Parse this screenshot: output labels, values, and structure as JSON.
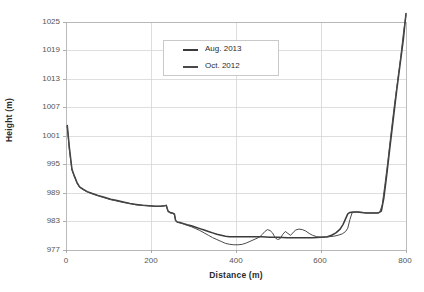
{
  "chart_data": {
    "type": "line",
    "title": "",
    "xlabel": "Distance (m)",
    "ylabel": "Height (m)",
    "xlim": [
      0,
      800
    ],
    "ylim": [
      977,
      1025
    ],
    "xticks": [
      0,
      200,
      400,
      600,
      800
    ],
    "yticks": [
      977,
      983,
      989,
      995,
      1001,
      1007,
      1013,
      1019,
      1025
    ],
    "grid": true,
    "legend_position": "top-center",
    "series": [
      {
        "name": "Aug. 2013",
        "color": "#3a3a3a",
        "points": [
          [
            3,
            1003.2
          ],
          [
            8,
            998.5
          ],
          [
            14,
            994.0
          ],
          [
            20,
            992.5
          ],
          [
            26,
            991.2
          ],
          [
            32,
            990.3
          ],
          [
            40,
            989.8
          ],
          [
            50,
            989.3
          ],
          [
            62,
            988.9
          ],
          [
            75,
            988.5
          ],
          [
            90,
            988.1
          ],
          [
            105,
            987.7
          ],
          [
            120,
            987.4
          ],
          [
            135,
            987.1
          ],
          [
            150,
            986.8
          ],
          [
            165,
            986.6
          ],
          [
            180,
            986.4
          ],
          [
            195,
            986.3
          ],
          [
            210,
            986.2
          ],
          [
            222,
            986.2
          ],
          [
            232,
            986.3
          ],
          [
            236,
            986.4
          ],
          [
            240,
            985.2
          ],
          [
            245,
            984.9
          ],
          [
            250,
            984.8
          ],
          [
            255,
            984.6
          ],
          [
            258,
            983.2
          ],
          [
            262,
            982.9
          ],
          [
            268,
            982.8
          ],
          [
            275,
            982.6
          ],
          [
            285,
            982.3
          ],
          [
            295,
            982.1
          ],
          [
            305,
            981.8
          ],
          [
            315,
            981.5
          ],
          [
            325,
            981.2
          ],
          [
            335,
            980.9
          ],
          [
            345,
            980.6
          ],
          [
            355,
            980.3
          ],
          [
            365,
            980.1
          ],
          [
            375,
            979.9
          ],
          [
            385,
            979.8
          ],
          [
            395,
            979.8
          ],
          [
            405,
            979.8
          ],
          [
            420,
            979.8
          ],
          [
            440,
            979.8
          ],
          [
            460,
            979.8
          ],
          [
            480,
            979.7
          ],
          [
            500,
            979.7
          ],
          [
            520,
            979.6
          ],
          [
            540,
            979.6
          ],
          [
            560,
            979.6
          ],
          [
            580,
            979.6
          ],
          [
            600,
            979.7
          ],
          [
            615,
            979.8
          ],
          [
            625,
            980.1
          ],
          [
            635,
            980.6
          ],
          [
            645,
            981.4
          ],
          [
            652,
            982.4
          ],
          [
            658,
            983.6
          ],
          [
            663,
            984.6
          ],
          [
            668,
            984.9
          ],
          [
            675,
            985.0
          ],
          [
            685,
            985.0
          ],
          [
            695,
            984.9
          ],
          [
            705,
            984.8
          ],
          [
            715,
            984.8
          ],
          [
            725,
            984.8
          ],
          [
            735,
            984.8
          ],
          [
            742,
            985.2
          ],
          [
            748,
            988.0
          ],
          [
            755,
            993.0
          ],
          [
            762,
            998.5
          ],
          [
            770,
            1004.5
          ],
          [
            778,
            1010.5
          ],
          [
            786,
            1016.0
          ],
          [
            794,
            1021.5
          ],
          [
            800,
            1026.8
          ]
        ]
      },
      {
        "name": "Oct. 2012",
        "color": "#4a4a4a",
        "points": [
          [
            3,
            1003.0
          ],
          [
            8,
            998.0
          ],
          [
            14,
            993.8
          ],
          [
            20,
            992.4
          ],
          [
            26,
            991.0
          ],
          [
            32,
            990.2
          ],
          [
            40,
            989.7
          ],
          [
            50,
            989.2
          ],
          [
            62,
            988.8
          ],
          [
            75,
            988.4
          ],
          [
            90,
            988.0
          ],
          [
            105,
            987.6
          ],
          [
            120,
            987.3
          ],
          [
            135,
            987.0
          ],
          [
            150,
            986.8
          ],
          [
            165,
            986.5
          ],
          [
            180,
            986.4
          ],
          [
            195,
            986.3
          ],
          [
            210,
            986.2
          ],
          [
            222,
            986.2
          ],
          [
            232,
            986.3
          ],
          [
            236,
            986.4
          ],
          [
            240,
            985.1
          ],
          [
            245,
            984.8
          ],
          [
            250,
            984.7
          ],
          [
            255,
            984.5
          ],
          [
            258,
            983.1
          ],
          [
            262,
            982.8
          ],
          [
            268,
            982.7
          ],
          [
            275,
            982.5
          ],
          [
            285,
            982.2
          ],
          [
            295,
            981.9
          ],
          [
            305,
            981.5
          ],
          [
            315,
            981.1
          ],
          [
            325,
            980.6
          ],
          [
            335,
            980.1
          ],
          [
            345,
            979.6
          ],
          [
            355,
            979.2
          ],
          [
            365,
            978.8
          ],
          [
            375,
            978.4
          ],
          [
            385,
            978.2
          ],
          [
            395,
            978.1
          ],
          [
            405,
            978.1
          ],
          [
            415,
            978.2
          ],
          [
            425,
            978.5
          ],
          [
            435,
            978.9
          ],
          [
            445,
            979.3
          ],
          [
            455,
            979.7
          ],
          [
            462,
            980.3
          ],
          [
            468,
            980.9
          ],
          [
            474,
            981.3
          ],
          [
            480,
            981.1
          ],
          [
            486,
            980.6
          ],
          [
            492,
            979.6
          ],
          [
            498,
            979.2
          ],
          [
            504,
            979.4
          ],
          [
            510,
            980.3
          ],
          [
            516,
            980.9
          ],
          [
            522,
            980.5
          ],
          [
            528,
            980.1
          ],
          [
            534,
            980.6
          ],
          [
            540,
            981.2
          ],
          [
            548,
            981.4
          ],
          [
            556,
            981.3
          ],
          [
            564,
            981.0
          ],
          [
            572,
            980.5
          ],
          [
            580,
            980.1
          ],
          [
            590,
            979.8
          ],
          [
            600,
            979.7
          ],
          [
            610,
            979.7
          ],
          [
            620,
            979.8
          ],
          [
            630,
            979.9
          ],
          [
            640,
            980.1
          ],
          [
            650,
            980.4
          ],
          [
            658,
            980.9
          ],
          [
            663,
            981.6
          ],
          [
            668,
            983.4
          ],
          [
            673,
            984.8
          ],
          [
            680,
            985.0
          ],
          [
            690,
            985.0
          ],
          [
            700,
            984.9
          ],
          [
            710,
            984.8
          ],
          [
            720,
            984.8
          ],
          [
            730,
            984.8
          ],
          [
            738,
            984.9
          ],
          [
            744,
            986.5
          ],
          [
            750,
            990.5
          ],
          [
            757,
            995.5
          ],
          [
            764,
            1001.0
          ],
          [
            772,
            1007.0
          ],
          [
            780,
            1012.5
          ],
          [
            788,
            1018.0
          ],
          [
            795,
            1023.5
          ],
          [
            800,
            1026.5
          ]
        ]
      }
    ]
  },
  "legend": {
    "items": [
      {
        "label": "Aug. 2013"
      },
      {
        "label": "Oct. 2012"
      }
    ]
  },
  "axes": {
    "y_title": "Height (m)",
    "x_title": "Distance (m)",
    "y_tick_labels": [
      "1025",
      "1019",
      "1013",
      "1007",
      "1001",
      "995",
      "989",
      "983",
      "977"
    ],
    "x_tick_labels": [
      "0",
      "200",
      "400",
      "600",
      "800"
    ]
  }
}
